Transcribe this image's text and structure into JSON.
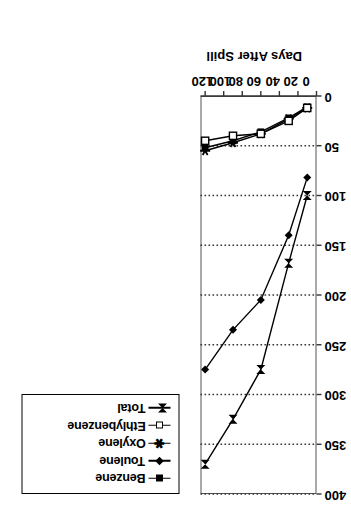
{
  "figure": {
    "background": "#ffffff",
    "line_color": "#000000",
    "grid_color": "#333333"
  },
  "legend": {
    "border_color": "#000000",
    "entries": [
      {
        "label": "Benzene",
        "marker": "filled-square-icon"
      },
      {
        "label": "Toulene",
        "marker": "filled-diamond-icon"
      },
      {
        "label": "Oxylene",
        "marker": "star-icon"
      },
      {
        "label": "Ethlybenzene",
        "marker": "open-square-icon"
      },
      {
        "label": "Total",
        "marker": "bowtie-icon"
      }
    ]
  },
  "chart_data": {
    "type": "line",
    "title": "",
    "xlabel": "Days After Spill",
    "ylabel": "Dissolved Benezene (Kg)",
    "xlim": [
      0,
      125
    ],
    "ylim": [
      0,
      400
    ],
    "xticks": [
      0,
      20,
      40,
      60,
      80,
      100,
      120
    ],
    "yticks": [
      0,
      50,
      100,
      150,
      200,
      250,
      300,
      350,
      400
    ],
    "grid": "y-gridlines-dotted",
    "legend_position": "top-left-outside",
    "x": [
      10,
      30,
      60,
      90,
      120
    ],
    "series": [
      {
        "name": "Benzene",
        "marker": "filled-square-icon",
        "values": [
          11,
          22,
          36,
          45,
          52
        ]
      },
      {
        "name": "Toulene",
        "marker": "filled-diamond-icon",
        "values": [
          82,
          140,
          205,
          235,
          275
        ]
      },
      {
        "name": "Oxylene",
        "marker": "star-icon",
        "values": [
          12,
          23,
          38,
          47,
          55
        ]
      },
      {
        "name": "Ethlybenzene",
        "marker": "open-square-icon",
        "values": [
          12,
          25,
          38,
          40,
          45
        ]
      },
      {
        "name": "Total",
        "marker": "bowtie-icon",
        "values": [
          100,
          168,
          275,
          325,
          370
        ]
      }
    ]
  }
}
